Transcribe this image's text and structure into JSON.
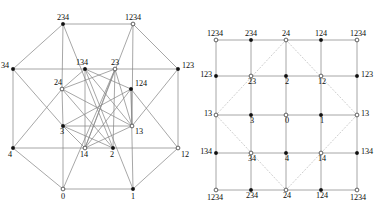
{
  "figure": {
    "type": "mathematical-diagram",
    "panels": [
      {
        "id": "left",
        "name": "octagonal-hypercube-drawing",
        "style": "octagonal projection with nested rotated squares",
        "nodes": [
          {
            "id": "n-234",
            "label": "234",
            "x": 63,
            "y": 24,
            "marker": "filled",
            "label_dx": 0,
            "label_dy": -4,
            "anchor": "middle"
          },
          {
            "id": "n-1234",
            "label": "1234",
            "x": 133,
            "y": 24,
            "marker": "open",
            "label_dx": 0,
            "label_dy": -4,
            "anchor": "middle"
          },
          {
            "id": "n-34",
            "label": "34",
            "x": 13,
            "y": 69,
            "marker": "filled",
            "label_dx": -4,
            "label_dy": -1,
            "anchor": "end"
          },
          {
            "id": "n-134",
            "label": "134",
            "x": 85,
            "y": 69,
            "marker": "filled",
            "label_dx": -3,
            "label_dy": -4,
            "anchor": "middle"
          },
          {
            "id": "n-23",
            "label": "23",
            "x": 115,
            "y": 69,
            "marker": "open",
            "label_dx": 0,
            "label_dy": -4,
            "anchor": "middle"
          },
          {
            "id": "n-123",
            "label": "123",
            "x": 178,
            "y": 69,
            "marker": "filled",
            "label_dx": 4,
            "label_dy": -1,
            "anchor": "start"
          },
          {
            "id": "n-24",
            "label": "24",
            "x": 62,
            "y": 89,
            "marker": "open",
            "label_dx": -4,
            "label_dy": -4,
            "anchor": "middle"
          },
          {
            "id": "n-124",
            "label": "124",
            "x": 131,
            "y": 89,
            "marker": "filled",
            "label_dx": 4,
            "label_dy": -3,
            "anchor": "start"
          },
          {
            "id": "n-3",
            "label": "3",
            "x": 63,
            "y": 126,
            "marker": "filled",
            "label_dx": -1,
            "label_dy": 8,
            "anchor": "middle"
          },
          {
            "id": "n-13",
            "label": "13",
            "x": 132,
            "y": 126,
            "marker": "open",
            "label_dx": 3,
            "label_dy": 8,
            "anchor": "start"
          },
          {
            "id": "n-4",
            "label": "4",
            "x": 13,
            "y": 148,
            "marker": "filled",
            "label_dx": -3,
            "label_dy": 9,
            "anchor": "middle"
          },
          {
            "id": "n-14",
            "label": "14",
            "x": 85,
            "y": 148,
            "marker": "open",
            "label_dx": -1,
            "label_dy": 9,
            "anchor": "middle"
          },
          {
            "id": "n-2",
            "label": "2",
            "x": 113,
            "y": 148,
            "marker": "filled",
            "label_dx": -1,
            "label_dy": 9,
            "anchor": "middle"
          },
          {
            "id": "n-12",
            "label": "12",
            "x": 178,
            "y": 148,
            "marker": "open",
            "label_dx": 3,
            "label_dy": 9,
            "anchor": "start"
          },
          {
            "id": "n-0",
            "label": "0",
            "x": 63,
            "y": 189,
            "marker": "open",
            "label_dx": 0,
            "label_dy": 10,
            "anchor": "middle"
          },
          {
            "id": "n-1",
            "label": "1",
            "x": 133,
            "y": 189,
            "marker": "filled",
            "label_dx": 0,
            "label_dy": 10,
            "anchor": "middle"
          }
        ],
        "edges": [
          [
            "n-234",
            "n-1234"
          ],
          [
            "n-234",
            "n-34"
          ],
          [
            "n-1234",
            "n-123"
          ],
          [
            "n-34",
            "n-4"
          ],
          [
            "n-123",
            "n-12"
          ],
          [
            "n-4",
            "n-0"
          ],
          [
            "n-0",
            "n-1"
          ],
          [
            "n-1",
            "n-12"
          ],
          [
            "n-234",
            "n-24"
          ],
          [
            "n-234",
            "n-2"
          ],
          [
            "n-1234",
            "n-13"
          ],
          [
            "n-1234",
            "n-14"
          ],
          [
            "n-34",
            "n-134"
          ],
          [
            "n-34",
            "n-3"
          ],
          [
            "n-123",
            "n-23"
          ],
          [
            "n-123",
            "n-13"
          ],
          [
            "n-4",
            "n-14"
          ],
          [
            "n-4",
            "n-24"
          ],
          [
            "n-12",
            "n-2"
          ],
          [
            "n-12",
            "n-124"
          ],
          [
            "n-0",
            "n-3"
          ],
          [
            "n-0",
            "n-23"
          ],
          [
            "n-1",
            "n-124"
          ],
          [
            "n-1",
            "n-134"
          ],
          [
            "n-134",
            "n-23"
          ],
          [
            "n-134",
            "n-24"
          ],
          [
            "n-134",
            "n-14"
          ],
          [
            "n-134",
            "n-124"
          ],
          [
            "n-23",
            "n-13"
          ],
          [
            "n-23",
            "n-2"
          ],
          [
            "n-23",
            "n-24"
          ],
          [
            "n-24",
            "n-3"
          ],
          [
            "n-24",
            "n-2"
          ],
          [
            "n-124",
            "n-13"
          ],
          [
            "n-124",
            "n-14"
          ],
          [
            "n-3",
            "n-13"
          ],
          [
            "n-3",
            "n-14"
          ],
          [
            "n-13",
            "n-14"
          ],
          [
            "n-3",
            "n-2"
          ],
          [
            "n-14",
            "n-2"
          ],
          [
            "n-134",
            "n-13"
          ],
          [
            "n-24",
            "n-13"
          ],
          [
            "n-23",
            "n-14"
          ],
          [
            "n-124",
            "n-3"
          ]
        ]
      },
      {
        "id": "right",
        "name": "torus-grid-drawing",
        "style": "5x5 grid on a torus with dotted diamond",
        "grid_x": [
          216,
          251,
          286,
          321,
          357
        ],
        "grid_y": [
          40,
          76,
          115,
          153,
          190
        ],
        "nodes": [
          {
            "id": "r00",
            "label": "1234",
            "col": 0,
            "row": 0,
            "marker": "open",
            "pos": "above-left"
          },
          {
            "id": "r10",
            "label": "234",
            "col": 1,
            "row": 0,
            "marker": "filled",
            "pos": "above"
          },
          {
            "id": "r20",
            "label": "24",
            "col": 2,
            "row": 0,
            "marker": "open",
            "pos": "above"
          },
          {
            "id": "r30",
            "label": "124",
            "col": 3,
            "row": 0,
            "marker": "filled",
            "pos": "above"
          },
          {
            "id": "r40",
            "label": "1234",
            "col": 4,
            "row": 0,
            "marker": "open",
            "pos": "above-right"
          },
          {
            "id": "r01",
            "label": "123",
            "col": 0,
            "row": 1,
            "marker": "filled",
            "pos": "left"
          },
          {
            "id": "r11",
            "label": "23",
            "col": 1,
            "row": 1,
            "marker": "open",
            "pos": "below"
          },
          {
            "id": "r21",
            "label": "2",
            "col": 2,
            "row": 1,
            "marker": "filled",
            "pos": "below"
          },
          {
            "id": "r31",
            "label": "12",
            "col": 3,
            "row": 1,
            "marker": "open",
            "pos": "below"
          },
          {
            "id": "r41",
            "label": "123",
            "col": 4,
            "row": 1,
            "marker": "filled",
            "pos": "right"
          },
          {
            "id": "r02",
            "label": "13",
            "col": 0,
            "row": 2,
            "marker": "open",
            "pos": "left"
          },
          {
            "id": "r12",
            "label": "3",
            "col": 1,
            "row": 2,
            "marker": "filled",
            "pos": "below"
          },
          {
            "id": "r22",
            "label": "0",
            "col": 2,
            "row": 2,
            "marker": "open",
            "pos": "below"
          },
          {
            "id": "r32",
            "label": "1",
            "col": 3,
            "row": 2,
            "marker": "filled",
            "pos": "below"
          },
          {
            "id": "r42",
            "label": "13",
            "col": 4,
            "row": 2,
            "marker": "open",
            "pos": "right"
          },
          {
            "id": "r03",
            "label": "134",
            "col": 0,
            "row": 3,
            "marker": "filled",
            "pos": "left"
          },
          {
            "id": "r13",
            "label": "34",
            "col": 1,
            "row": 3,
            "marker": "open",
            "pos": "below"
          },
          {
            "id": "r23",
            "label": "4",
            "col": 2,
            "row": 3,
            "marker": "filled",
            "pos": "below"
          },
          {
            "id": "r33",
            "label": "14",
            "col": 3,
            "row": 3,
            "marker": "open",
            "pos": "below"
          },
          {
            "id": "r43",
            "label": "134",
            "col": 4,
            "row": 3,
            "marker": "filled",
            "pos": "right"
          },
          {
            "id": "r04",
            "label": "1234",
            "col": 0,
            "row": 4,
            "marker": "open",
            "pos": "below-left"
          },
          {
            "id": "r14",
            "label": "234",
            "col": 1,
            "row": 4,
            "marker": "filled",
            "pos": "below"
          },
          {
            "id": "r24",
            "label": "24",
            "col": 2,
            "row": 4,
            "marker": "open",
            "pos": "below"
          },
          {
            "id": "r34",
            "label": "124",
            "col": 3,
            "row": 4,
            "marker": "filled",
            "pos": "below"
          },
          {
            "id": "r44",
            "label": "1234",
            "col": 4,
            "row": 4,
            "marker": "open",
            "pos": "below-right"
          }
        ],
        "diamond": {
          "name": "dotted-diamond",
          "points": [
            [
              286,
              40
            ],
            [
              216,
              115
            ],
            [
              286,
              190
            ],
            [
              357,
              115
            ]
          ]
        }
      }
    ]
  },
  "colors": {
    "edge": "#8a8a8a",
    "dotted": "#c2c2c2",
    "node_fill": "#101010",
    "node_open": "#ffffff",
    "label": "#0c0c0c",
    "background": "#ffffff"
  }
}
